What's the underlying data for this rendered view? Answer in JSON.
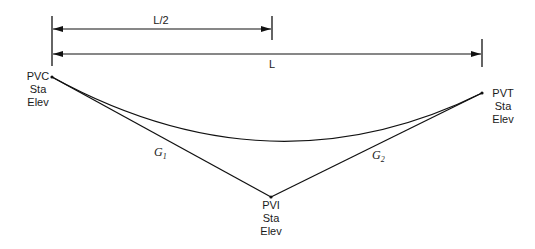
{
  "diagram": {
    "type": "vertical-curve",
    "dimensions": {
      "half_length_label": "L/2",
      "full_length_label": "L"
    },
    "points": {
      "pvc": {
        "name": "PVC",
        "line2": "Sta",
        "line3": "Elev"
      },
      "pvt": {
        "name": "PVT",
        "line2": "Sta",
        "line3": "Elev"
      },
      "pvi": {
        "name": "PVI",
        "line2": "Sta",
        "line3": "Elev"
      }
    },
    "grades": {
      "g1": {
        "letter": "G",
        "sub": "1"
      },
      "g2": {
        "letter": "G",
        "sub": "2"
      }
    },
    "colors": {
      "line": "#111111",
      "background": "#ffffff"
    }
  }
}
